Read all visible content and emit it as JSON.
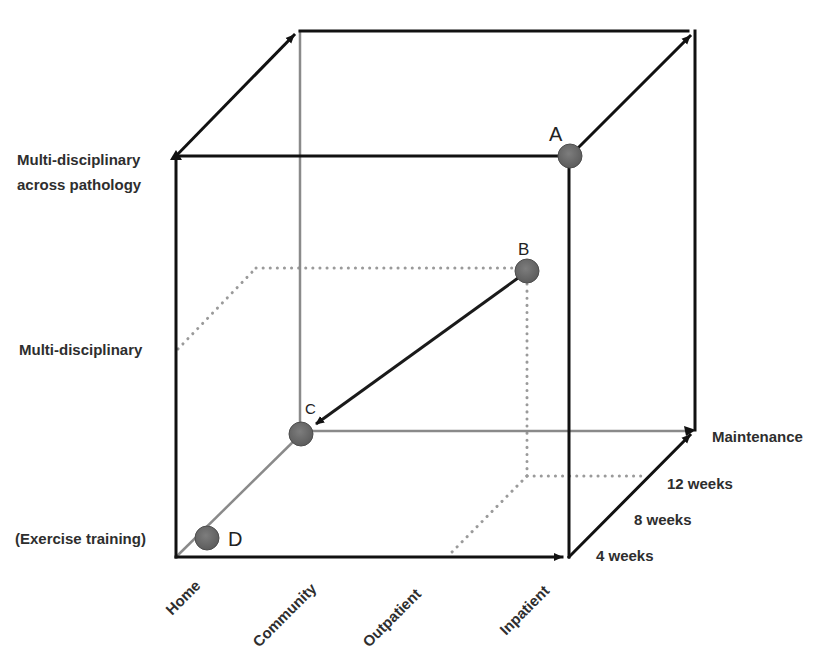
{
  "diagram": {
    "type": "3d-cube",
    "colors": {
      "edge_dark": "#111111",
      "edge_grey": "#8a8a8a",
      "dotted": "#9a9a9a",
      "point_fill": "#6e6e6e",
      "point_stroke": "#555555",
      "text": "#2e2e2e"
    },
    "vertical_axis": {
      "labels": [
        {
          "text": "Multi-disciplinary",
          "line": 1
        },
        {
          "text": "across pathology",
          "line": 2
        },
        {
          "text": "Multi-disciplinary"
        },
        {
          "text": "(Exercise training)"
        }
      ]
    },
    "horizontal_axis": {
      "labels": [
        "Home",
        "Community",
        "Outpatient",
        "Inpatient"
      ]
    },
    "depth_axis": {
      "labels": [
        "4 weeks",
        "8 weeks",
        "12 weeks",
        "Maintenance"
      ]
    },
    "points": [
      {
        "id": "A",
        "label": "A",
        "x": 570,
        "y": 156
      },
      {
        "id": "B",
        "label": "B",
        "x": 527,
        "y": 271
      },
      {
        "id": "C",
        "label": "C",
        "x": 301,
        "y": 434
      },
      {
        "id": "D",
        "label": "D",
        "x": 207,
        "y": 538
      }
    ],
    "arrow": {
      "from": "B",
      "to": "C"
    }
  }
}
